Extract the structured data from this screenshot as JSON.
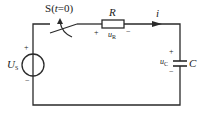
{
  "diagram": {
    "type": "RC circuit",
    "colors": {
      "wire": "#2a2a2a",
      "background": "#ffffff"
    },
    "switch": {
      "label": "S",
      "condition_var": "t",
      "condition": "=0"
    },
    "resistor": {
      "label": "R",
      "voltage_label": "u",
      "voltage_sub": "R",
      "plus": "+",
      "minus": "−"
    },
    "current": {
      "label": "i"
    },
    "source": {
      "label": "U",
      "sub": "S",
      "plus": "+",
      "minus": "−"
    },
    "capacitor": {
      "label": "C",
      "voltage_label": "u",
      "voltage_sub": "C",
      "plus": "+",
      "minus": "−"
    }
  }
}
